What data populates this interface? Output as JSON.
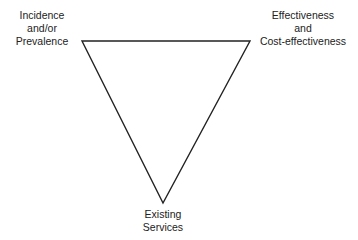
{
  "figure": {
    "type": "triangle-relationship-diagram",
    "background_color": "#ffffff",
    "line_color": "#222222",
    "line_width": 1.4,
    "vertices": {
      "top_left": {
        "x": 82,
        "y": 41
      },
      "top_right": {
        "x": 250,
        "y": 41
      },
      "bottom": {
        "x": 163,
        "y": 203
      }
    }
  },
  "nodes": {
    "incidence": {
      "name": "Incidence and/or Prevalence",
      "lines": [
        "Incidence",
        "and/or",
        "Prevalence"
      ]
    },
    "effectiveness": {
      "name": "Effectiveness and Cost-effectiveness",
      "lines": [
        "Effectiveness",
        "and",
        "Cost-effectiveness"
      ]
    },
    "existing_services": {
      "name": "Existing Services",
      "lines": [
        "Existing",
        "Services"
      ]
    }
  }
}
